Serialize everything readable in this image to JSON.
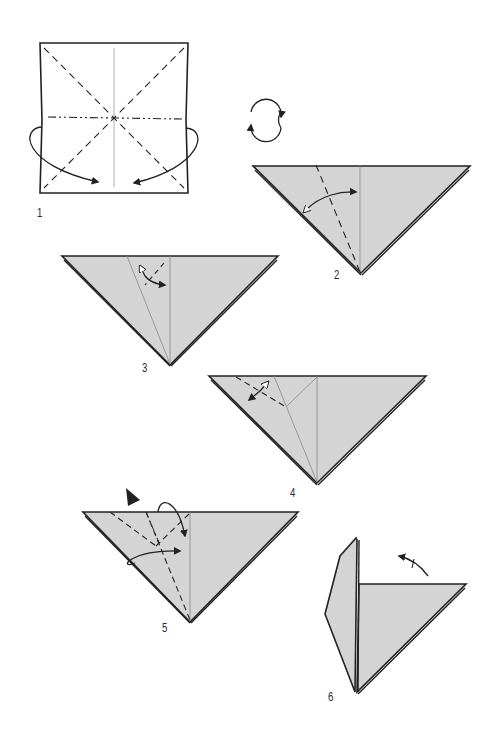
{
  "diagram": {
    "type": "origami-instructions",
    "colors": {
      "paper_fill": "#d4d4d4",
      "line": "#222222",
      "background": "#ffffff"
    },
    "steps": [
      {
        "number": "1",
        "label": "1",
        "description": "Square sheet: diagonal valley folds, horizontal mountain fold, vertical center crease; collapse sides down"
      },
      {
        "number": "2",
        "label": "2",
        "description": "Triangle: fold and unfold left flap along dashed line"
      },
      {
        "number": "3",
        "label": "3",
        "description": "Triangle with crease: small fold and unfold at top"
      },
      {
        "number": "4",
        "label": "4",
        "description": "Triangle with creases: fold and unfold upper left corner"
      },
      {
        "number": "5",
        "label": "5",
        "description": "Triangle: push in (sink) top and reverse fold"
      },
      {
        "number": "6",
        "label": "6",
        "description": "Result: flap stands up, rotate/turn"
      }
    ],
    "symbols": {
      "turn_over": "turn-over-icon"
    }
  }
}
